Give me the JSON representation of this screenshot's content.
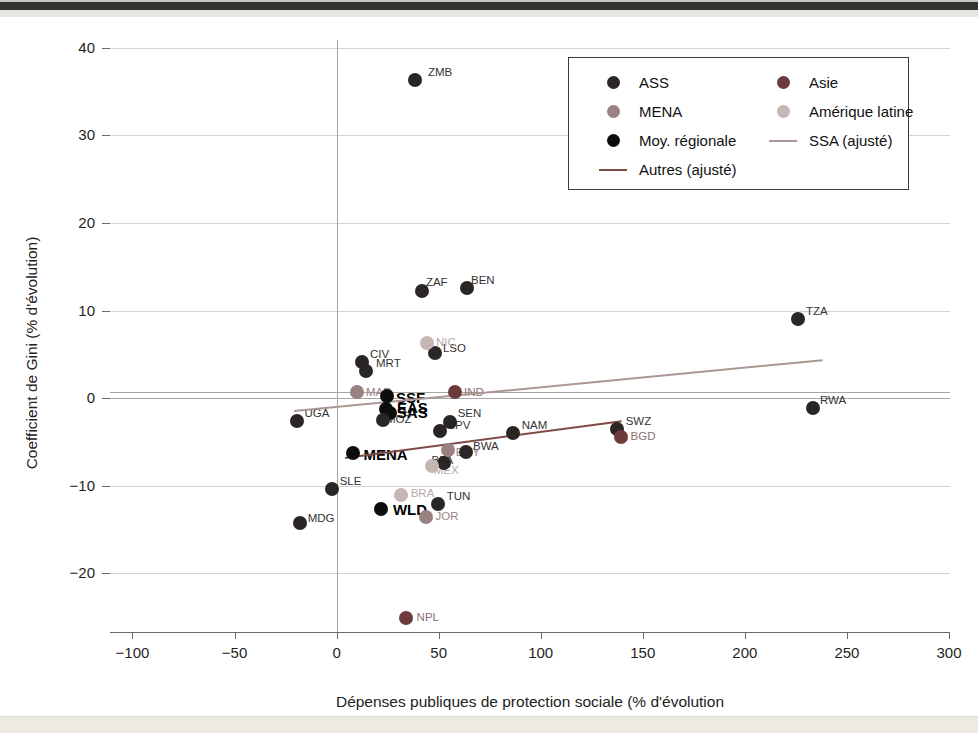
{
  "window": {
    "top_strip_color": "#343431"
  },
  "chart_data": {
    "type": "scatter",
    "title": "",
    "xlabel": "Dépenses publiques de protection sociale (% d'évolution",
    "ylabel": "Coefficient de Gini (% d'évolution)",
    "xlim": [
      -111,
      300.5
    ],
    "ylim": [
      -26.7,
      40.9
    ],
    "xticks": [
      -100,
      -50,
      0,
      50,
      100,
      150,
      200,
      250,
      300
    ],
    "yticks": [
      40,
      30,
      20,
      10,
      0,
      -10,
      -20
    ],
    "grid": "horizontal",
    "zero_reference": {
      "horizontal": [
        0,
        0.7
      ],
      "vertical": [
        0
      ]
    },
    "plot_px": {
      "left": 110,
      "top": 40,
      "width": 840,
      "height": 592
    },
    "colors": {
      "ASS": "#2b2626",
      "Asie": "#6d3b3b",
      "MENA": "#9b8181",
      "AmLat": "#c6b6b4",
      "Moy": "#0d0d0d",
      "ssa_line": "#ab9894",
      "autres_line": "#7e4b47",
      "label_ASS": "#333333",
      "label_Asie": "#8c6f6f",
      "label_MENA": "#9a8484",
      "label_AmLat": "#b8a8a8",
      "label_Moy": "#000000"
    },
    "legend": {
      "position": "top-right",
      "entries": [
        {
          "label": "ASS",
          "marker": "dot",
          "color_key": "ASS"
        },
        {
          "label": "Asie",
          "marker": "dot",
          "color_key": "Asie"
        },
        {
          "label": "MENA",
          "marker": "dot",
          "color_key": "MENA"
        },
        {
          "label": "Amérique latine",
          "marker": "dot",
          "color_key": "AmLat"
        },
        {
          "label": "Moy. régionale",
          "marker": "dot",
          "color_key": "Moy"
        },
        {
          "label": "SSA (ajusté)",
          "marker": "line",
          "color_key": "ssa_line"
        },
        {
          "label": "Autres (ajusté)",
          "marker": "line",
          "color_key": "autres_line"
        }
      ]
    },
    "fit_lines": [
      {
        "name": "SSA (ajusté)",
        "key": "ssa",
        "color_key": "ssa_line",
        "x1": -21,
        "y1": -1.35,
        "x2": 238,
        "y2": 4.45
      },
      {
        "name": "Autres (ajusté)",
        "key": "autres",
        "color_key": "autres_line",
        "x1": 4,
        "y1": -6.7,
        "x2": 139.5,
        "y2": -2.5
      }
    ],
    "points": [
      {
        "code": "ZMB",
        "region": "ASS",
        "x": 38.4,
        "y": 36.3,
        "dx": 13,
        "dy": -14
      },
      {
        "code": "ZAF",
        "region": "ASS",
        "x": 41.8,
        "y": 12.2,
        "dx": 4,
        "dy": -15
      },
      {
        "code": "BEN",
        "region": "ASS",
        "x": 63.9,
        "y": 12.6,
        "dx": 4,
        "dy": -14
      },
      {
        "code": "TZA",
        "region": "ASS",
        "x": 226.0,
        "y": 9.0,
        "dx": 8,
        "dy": -14
      },
      {
        "code": "RWA",
        "region": "ASS",
        "x": 233.4,
        "y": -1.1,
        "dx": 7,
        "dy": -14
      },
      {
        "code": "CIV",
        "region": "ASS",
        "x": 12.4,
        "y": 4.1,
        "dx": 8,
        "dy": -14
      },
      {
        "code": "MRT",
        "region": "ASS",
        "x": 14.4,
        "y": 3.1,
        "dx": 10,
        "dy": -14
      },
      {
        "code": "LSO",
        "region": "ASS",
        "x": 48.2,
        "y": 5.2,
        "dx": 8,
        "dy": -11
      },
      {
        "code": "NIC",
        "region": "AmLat",
        "x": 44.3,
        "y": 6.3,
        "dx": 9,
        "dy": -7
      },
      {
        "code": "MAR",
        "region": "MENA",
        "x": 10.0,
        "y": 0.7,
        "dx": 9,
        "dy": -6
      },
      {
        "code": "IND",
        "region": "Asie",
        "x": 58.0,
        "y": 0.7,
        "dx": 9,
        "dy": -6
      },
      {
        "code": "SSF",
        "region": "Moy",
        "x": 24.7,
        "y": 0.2,
        "dx": 9,
        "dy": -7,
        "bold": true
      },
      {
        "code": "EAS",
        "region": "Moy",
        "x": 24.2,
        "y": -1.2,
        "dx": 11,
        "dy": -10,
        "bold": true
      },
      {
        "code": "SAS",
        "region": "Moy",
        "x": 26.1,
        "y": -1.7,
        "dx": 7,
        "dy": -9,
        "bold": true
      },
      {
        "code": "MOZ",
        "region": "ASS",
        "x": 22.7,
        "y": -2.5,
        "dx": 3,
        "dy": -7
      },
      {
        "code": "UGA",
        "region": "ASS",
        "x": -19.6,
        "y": -2.6,
        "dx": 8,
        "dy": -14
      },
      {
        "code": "SEN",
        "region": "ASS",
        "x": 55.4,
        "y": -2.7,
        "dx": 8,
        "dy": -15
      },
      {
        "code": "CPV",
        "region": "ASS",
        "x": 50.5,
        "y": -3.8,
        "dx": 7,
        "dy": -12
      },
      {
        "code": "MENA",
        "region": "Moy",
        "x": 7.8,
        "y": -6.3,
        "dx": 11,
        "dy": -7,
        "bold": true
      },
      {
        "code": "NAM",
        "region": "ASS",
        "x": 86.3,
        "y": -4.0,
        "dx": 9,
        "dy": -14
      },
      {
        "code": "SWZ",
        "region": "ASS",
        "x": 137.2,
        "y": -3.5,
        "dx": 9,
        "dy": -14
      },
      {
        "code": "BGD",
        "region": "Asie",
        "x": 139.1,
        "y": -4.4,
        "dx": 10,
        "dy": -7
      },
      {
        "code": "BWA",
        "region": "ASS",
        "x": 63.4,
        "y": -6.2,
        "dx": 7,
        "dy": -12
      },
      {
        "code": "EGY",
        "region": "MENA",
        "x": 54.4,
        "y": -5.9,
        "dx": 8,
        "dy": -4
      },
      {
        "code": "BFA",
        "region": "ASS",
        "x": 52.4,
        "y": -7.4,
        "dx": -12,
        "dy": -9
      },
      {
        "code": "MEX",
        "region": "AmLat",
        "x": 46.6,
        "y": -7.8,
        "dx": 2,
        "dy": -2
      },
      {
        "code": "SLE",
        "region": "ASS",
        "x": -2.4,
        "y": -10.4,
        "dx": 8,
        "dy": -14
      },
      {
        "code": "TUN",
        "region": "ASS",
        "x": 49.5,
        "y": -12.1,
        "dx": 9,
        "dy": -14
      },
      {
        "code": "BRA",
        "region": "AmLat",
        "x": 31.4,
        "y": -11.1,
        "dx": 10,
        "dy": -8
      },
      {
        "code": "JOR",
        "region": "MENA",
        "x": 43.6,
        "y": -13.6,
        "dx": 10,
        "dy": -7
      },
      {
        "code": "WLD",
        "region": "Moy",
        "x": 21.7,
        "y": -12.7,
        "dx": 12,
        "dy": -8,
        "bold": true
      },
      {
        "code": "MDG",
        "region": "ASS",
        "x": -18.1,
        "y": -14.3,
        "dx": 8,
        "dy": -11
      },
      {
        "code": "NPL",
        "region": "Asie",
        "x": 33.8,
        "y": -25.1,
        "dx": 11,
        "dy": -7
      }
    ]
  }
}
